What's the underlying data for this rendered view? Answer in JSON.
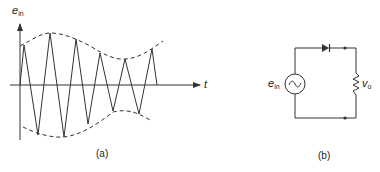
{
  "figure_a": {
    "caption": "(a)",
    "y_axis_label": "e",
    "y_axis_label_sub": "in",
    "x_axis_label": "t",
    "waveform": "amplitude-modulated oscillation with dashed envelope"
  },
  "figure_b": {
    "caption": "(b)",
    "source_label": "e",
    "source_label_sub": "in",
    "source_symbol": "~",
    "output_label": "v",
    "output_label_sub": "o",
    "components": [
      "ac-source",
      "diode",
      "resistor"
    ]
  },
  "colors": {
    "line": "#333333",
    "background": "#ffffff"
  }
}
